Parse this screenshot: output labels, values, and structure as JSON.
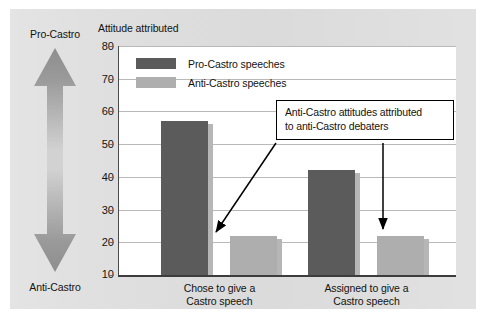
{
  "figure": {
    "background_color": "#dedede",
    "plot_background": "#ffffff"
  },
  "axis_arrow": {
    "top_label": "Pro-Castro",
    "bottom_label": "Anti-Castro",
    "icon": "double-headed-vertical-arrow"
  },
  "legend": {
    "position": "top-left-inside-plot",
    "entries": [
      {
        "label": "Pro-Castro speeches",
        "color": "#5b5b5b"
      },
      {
        "label": "Anti-Castro speeches",
        "color": "#aeaeae"
      }
    ]
  },
  "callout": {
    "text": "Anti-Castro attitudes attributed to anti-Castro debaters",
    "line1": "Anti-Castro attitudes attributed",
    "line2": "to anti-Castro debaters",
    "border_color": "#000000",
    "points_to": [
      "Chose to give a Castro speech / Anti-Castro speeches bar",
      "Assigned to give a Castro speech / Anti-Castro speeches bar"
    ]
  },
  "chart_data": {
    "type": "bar",
    "title": "Attitude attributed",
    "xlabel": "",
    "ylabel": "Attitude attributed",
    "categories": [
      "Chose to give a Castro speech",
      "Assigned to give a Castro speech"
    ],
    "category_lines": [
      [
        "Chose to give a",
        "Castro speech"
      ],
      [
        "Assigned to give a",
        "Castro speech"
      ]
    ],
    "series": [
      {
        "name": "Pro-Castro speeches",
        "color": "#5b5b5b",
        "values": [
          57,
          42
        ]
      },
      {
        "name": "Anti-Castro speeches",
        "color": "#aeaeae",
        "values": [
          22,
          22
        ]
      }
    ],
    "ylim": [
      10,
      80
    ],
    "yticks": [
      10,
      20,
      30,
      40,
      50,
      60,
      70,
      80
    ],
    "ytick_labels": [
      "10",
      "20",
      "30",
      "40",
      "50",
      "60",
      "70",
      "80"
    ],
    "grid": true,
    "grid_axis": "y",
    "legend_position": "upper left"
  }
}
